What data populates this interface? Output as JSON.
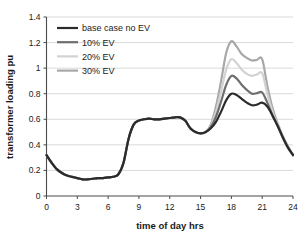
{
  "chart_data": {
    "type": "line",
    "title": "",
    "xlabel": "time of day hrs",
    "ylabel": "transformer loading pu",
    "xlim": [
      0,
      24
    ],
    "ylim": [
      0,
      1.4
    ],
    "xticks": [
      "0",
      "3",
      "6",
      "9",
      "12",
      "15",
      "18",
      "21",
      "24"
    ],
    "yticks": [
      "0",
      "0.2",
      "0.4",
      "0.6",
      "0.8",
      "1",
      "1.2",
      "1.4"
    ],
    "grid": "horizontal",
    "legend_position": "top-left",
    "x": [
      0,
      0.5,
      1,
      1.5,
      2,
      2.5,
      3,
      3.5,
      4,
      4.5,
      5,
      5.5,
      6,
      6.5,
      7,
      7.5,
      8,
      8.5,
      9,
      9.5,
      10,
      10.5,
      11,
      11.5,
      12,
      12.5,
      13,
      13.5,
      14,
      14.5,
      15,
      15.5,
      16,
      16.5,
      17,
      17.5,
      18,
      18.5,
      19,
      19.5,
      20,
      20.5,
      21,
      21.5,
      22,
      22.5,
      23,
      23.5,
      24
    ],
    "series": [
      {
        "name": "base case no EV",
        "color": "#2b2b2b",
        "width": 2.2,
        "values": [
          0.32,
          0.26,
          0.21,
          0.18,
          0.16,
          0.15,
          0.14,
          0.13,
          0.13,
          0.135,
          0.14,
          0.14,
          0.145,
          0.15,
          0.17,
          0.26,
          0.45,
          0.56,
          0.59,
          0.6,
          0.605,
          0.6,
          0.6,
          0.605,
          0.61,
          0.615,
          0.615,
          0.59,
          0.53,
          0.5,
          0.49,
          0.5,
          0.53,
          0.58,
          0.66,
          0.75,
          0.8,
          0.79,
          0.76,
          0.73,
          0.71,
          0.715,
          0.73,
          0.7,
          0.63,
          0.55,
          0.46,
          0.38,
          0.32
        ]
      },
      {
        "name": "10% EV",
        "color": "#6e6e6e",
        "width": 2.2,
        "values": [
          0.32,
          0.26,
          0.21,
          0.18,
          0.16,
          0.15,
          0.14,
          0.13,
          0.13,
          0.135,
          0.14,
          0.14,
          0.145,
          0.15,
          0.17,
          0.26,
          0.45,
          0.56,
          0.59,
          0.6,
          0.605,
          0.6,
          0.6,
          0.605,
          0.61,
          0.615,
          0.615,
          0.59,
          0.53,
          0.5,
          0.49,
          0.5,
          0.54,
          0.62,
          0.74,
          0.87,
          0.94,
          0.92,
          0.87,
          0.83,
          0.8,
          0.805,
          0.81,
          0.73,
          0.63,
          0.55,
          0.46,
          0.38,
          0.32
        ]
      },
      {
        "name": "20% EV",
        "color": "#d2d2d2",
        "width": 2.2,
        "values": [
          0.32,
          0.26,
          0.21,
          0.18,
          0.16,
          0.15,
          0.14,
          0.13,
          0.13,
          0.135,
          0.14,
          0.14,
          0.145,
          0.15,
          0.17,
          0.26,
          0.45,
          0.56,
          0.59,
          0.6,
          0.605,
          0.6,
          0.6,
          0.605,
          0.61,
          0.615,
          0.615,
          0.59,
          0.53,
          0.5,
          0.49,
          0.5,
          0.55,
          0.66,
          0.82,
          0.99,
          1.07,
          1.04,
          0.99,
          0.955,
          0.94,
          0.95,
          0.96,
          0.8,
          0.66,
          0.56,
          0.46,
          0.38,
          0.32
        ]
      },
      {
        "name": "30% EV",
        "color": "#a8a8a8",
        "width": 2.2,
        "values": [
          0.32,
          0.26,
          0.21,
          0.18,
          0.16,
          0.15,
          0.14,
          0.13,
          0.13,
          0.135,
          0.14,
          0.14,
          0.145,
          0.15,
          0.17,
          0.26,
          0.45,
          0.56,
          0.59,
          0.6,
          0.605,
          0.6,
          0.6,
          0.605,
          0.61,
          0.615,
          0.615,
          0.59,
          0.53,
          0.5,
          0.49,
          0.5,
          0.56,
          0.7,
          0.9,
          1.12,
          1.21,
          1.17,
          1.11,
          1.08,
          1.06,
          1.065,
          1.07,
          0.86,
          0.69,
          0.57,
          0.47,
          0.39,
          0.32
        ]
      }
    ]
  },
  "legend": {
    "items": [
      {
        "label": "base case no EV"
      },
      {
        "label": "10% EV"
      },
      {
        "label": "20% EV"
      },
      {
        "label": "30% EV"
      }
    ]
  }
}
